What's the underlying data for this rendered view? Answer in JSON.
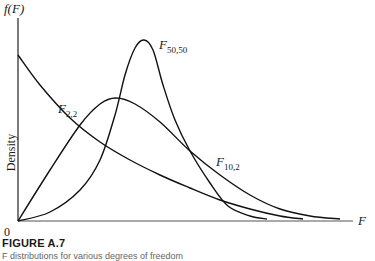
{
  "chart_data": {
    "type": "line",
    "title": "",
    "xlabel": "F",
    "ylabel": "Density",
    "ylabel_top": "f(F)",
    "origin_label": "0",
    "grid": false,
    "legend": "inline labels on curves",
    "series": [
      {
        "name": "F_{2,2}",
        "label_main": "F",
        "label_sub": "2,2",
        "shape": "monotonically decreasing from y-axis",
        "points_px": [
          [
            18,
            55
          ],
          [
            40,
            85
          ],
          [
            70,
            118
          ],
          [
            100,
            142
          ],
          [
            130,
            160
          ],
          [
            160,
            175
          ],
          [
            190,
            188
          ],
          [
            220,
            200
          ],
          [
            250,
            209
          ],
          [
            280,
            216
          ],
          [
            303,
            219
          ]
        ]
      },
      {
        "name": "F_{10,2}",
        "label_main": "F",
        "label_sub": "10,2",
        "shape": "right-skewed, peak near x=116",
        "points_px": [
          [
            18,
            221
          ],
          [
            50,
            170
          ],
          [
            80,
            125
          ],
          [
            100,
            104
          ],
          [
            116,
            98
          ],
          [
            135,
            104
          ],
          [
            160,
            122
          ],
          [
            190,
            151
          ],
          [
            220,
            175
          ],
          [
            250,
            195
          ],
          [
            280,
            209
          ],
          [
            310,
            216
          ],
          [
            340,
            219
          ]
        ]
      },
      {
        "name": "F_{50,50}",
        "label_main": "F",
        "label_sub": "50,50",
        "shape": "tall narrow peak near x=144",
        "points_px": [
          [
            18,
            221
          ],
          [
            50,
            212
          ],
          [
            80,
            190
          ],
          [
            100,
            160
          ],
          [
            115,
            115
          ],
          [
            125,
            75
          ],
          [
            135,
            48
          ],
          [
            144,
            40
          ],
          [
            153,
            50
          ],
          [
            163,
            85
          ],
          [
            175,
            120
          ],
          [
            190,
            151
          ],
          [
            210,
            183
          ],
          [
            228,
            206
          ],
          [
            250,
            216
          ],
          [
            267,
            219
          ]
        ]
      }
    ],
    "axis_px": {
      "origin": [
        18,
        221
      ],
      "y_top": 18,
      "x_end": 353
    }
  },
  "figure": {
    "title": "FIGURE A.7",
    "caption": "F distributions for various degrees of freedom"
  }
}
